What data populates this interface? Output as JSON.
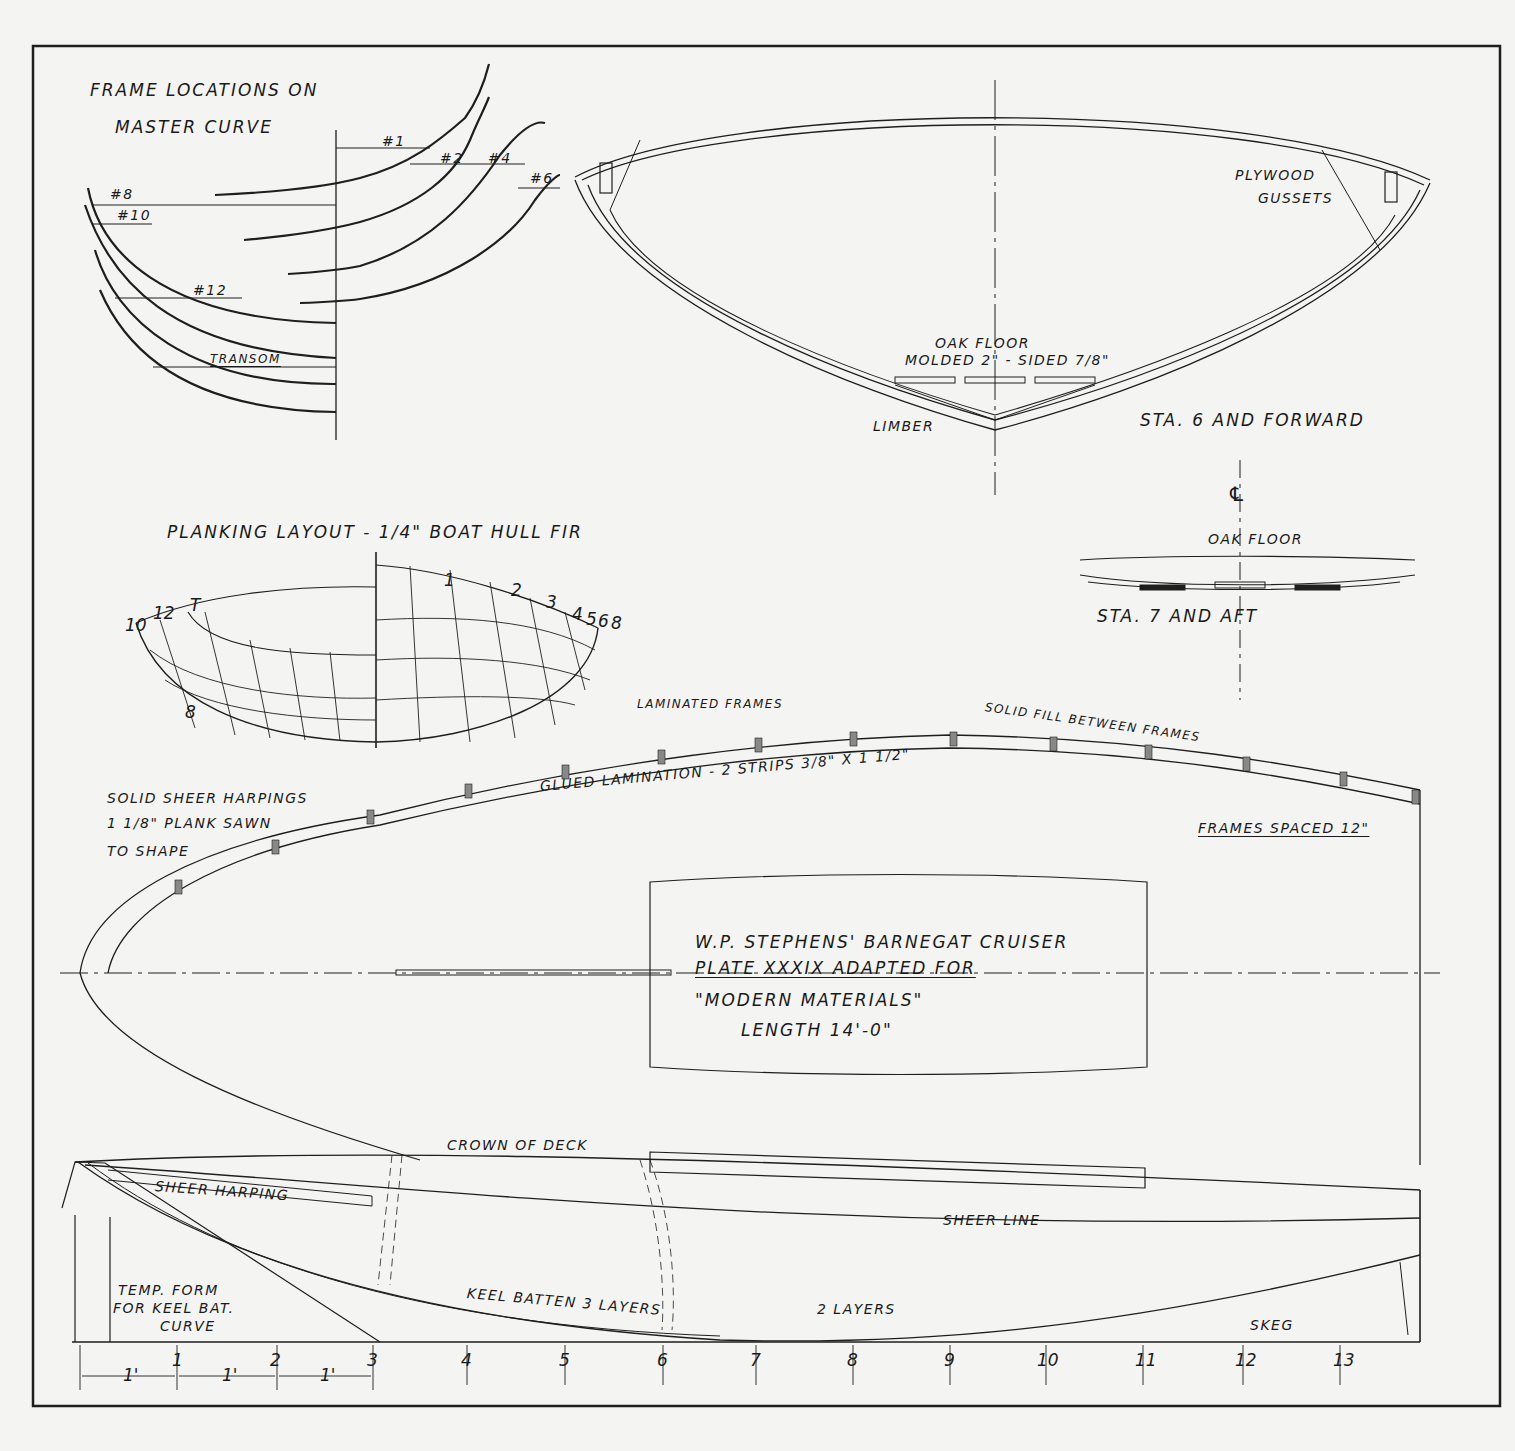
{
  "drawing": {
    "border_color": "#1e1e1e",
    "paper_color": "#f4f4f2",
    "frame_locations": {
      "title_line1": "FRAME LOCATIONS ON",
      "title_line2": "MASTER CURVE",
      "labels": [
        "#1",
        "#2",
        "#4",
        "#6",
        "#8",
        "#10",
        "#12",
        "TRANSOM"
      ]
    },
    "section_forward": {
      "plywood_line1": "PLYWOOD",
      "plywood_line2": "GUSSETS",
      "oak_floor_line1": "OAK FLOOR",
      "oak_floor_line2": "MOLDED 2\" - SIDED 7/8\"",
      "limber": "LIMBER",
      "caption": "STA. 6 AND FORWARD"
    },
    "section_aft": {
      "centerline_symbol": "℄",
      "oak_floor": "OAK FLOOR",
      "caption": "STA. 7 AND AFT"
    },
    "planking_layout": {
      "title": "PLANKING LAYOUT - 1/4\" BOAT HULL FIR",
      "left_labels": [
        "10",
        "12",
        "T",
        "8"
      ],
      "right_labels": [
        "1",
        "2",
        "3",
        "4",
        "5",
        "6",
        "8"
      ]
    },
    "plan_view": {
      "laminated_frames": "LAMINATED FRAMES",
      "solid_fill": "SOLID FILL BETWEEN FRAMES",
      "glued_lamination": "GLUED LAMINATION - 2 STRIPS 3/8\" x 1 1/2\"",
      "harpings_line1": "SOLID SHEER HARPINGS",
      "harpings_line2": "1 1/8\" PLANK SAWN",
      "harpings_line3": "TO SHAPE",
      "frames_spaced": "FRAMES SPACED 12\""
    },
    "title_block": {
      "line1": "W.P. STEPHENS' BARNEGAT CRUISER",
      "line2": "PLATE XXXIX ADAPTED FOR",
      "line3": "\"MODERN MATERIALS\"",
      "line4": "LENGTH 14'-0\""
    },
    "profile": {
      "crown_of_deck": "CROWN OF DECK",
      "sheer_harping": "SHEER HARPING",
      "sheer_line": "SHEER LINE",
      "temp_form_line1": "TEMP. FORM",
      "temp_form_line2": "FOR KEEL BAT.",
      "temp_form_line3": "CURVE",
      "keel_batten": "KEEL BATTEN 3 LAYERS",
      "two_layers": "2 LAYERS",
      "skeg": "SKEG"
    },
    "stations": {
      "labels": [
        "1",
        "2",
        "3",
        "4",
        "5",
        "6",
        "7",
        "8",
        "9",
        "10",
        "11",
        "12",
        "13"
      ],
      "spacing_label": "1'"
    }
  }
}
